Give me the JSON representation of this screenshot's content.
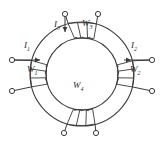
{
  "figure": {
    "type": "toroidal-core-winding-diagram",
    "background_color": "#ffffff",
    "line_color": "#3a3a3a",
    "label_color": "#2b2b2b"
  },
  "core": {
    "shape": "annulus",
    "center_x": 82,
    "center_y": 74,
    "outer_radius": 52,
    "inner_radius": 36
  },
  "windings": [
    {
      "id": "w1",
      "label_base": "W",
      "label_sub": "1",
      "position": "left",
      "angle_deg": 180,
      "turns": 3,
      "label_x": 28,
      "label_y": 70
    },
    {
      "id": "w2",
      "label_base": "W",
      "label_sub": "2",
      "position": "right",
      "angle_deg": 0,
      "turns": 3,
      "label_x": 130,
      "label_y": 70
    },
    {
      "id": "w3",
      "label_base": "W",
      "label_sub": "3",
      "position": "top",
      "angle_deg": 90,
      "turns": 3,
      "label_x": 86,
      "label_y": 25
    },
    {
      "id": "w4",
      "label_base": "W",
      "label_sub": "4",
      "position": "center-bottom",
      "angle_deg": 270,
      "turns": 3,
      "label_x": 76,
      "label_y": 86
    }
  ],
  "currents": [
    {
      "id": "i1",
      "label_base": "I",
      "label_sub": "1",
      "label_x": 24,
      "label_y": 48,
      "arrow": "right",
      "arrow_x1": 10,
      "arrow_y1": 60,
      "arrow_x2": 44,
      "arrow_y2": 60
    },
    {
      "id": "i2",
      "label_base": "I",
      "label_sub": "2",
      "label_x": 131,
      "label_y": 48,
      "arrow": "right",
      "arrow_x1": 120,
      "arrow_y1": 60,
      "arrow_x2": 152,
      "arrow_y2": 60
    },
    {
      "id": "i3",
      "label_base": "I",
      "label_sub": "3",
      "label_x": 56,
      "label_y": 26,
      "arrow": "down",
      "arrow_x1": 65,
      "arrow_y1": 14,
      "arrow_x2": 65,
      "arrow_y2": 34
    }
  ],
  "terminals": [
    {
      "id": "t-top-left",
      "cx": 65,
      "cy": 14
    },
    {
      "id": "t-top-right",
      "cx": 98,
      "cy": 14
    },
    {
      "id": "t-left-upper",
      "cx": 12,
      "cy": 60
    },
    {
      "id": "t-left-lower",
      "cx": 12,
      "cy": 91
    },
    {
      "id": "t-right-upper",
      "cx": 152,
      "cy": 60
    },
    {
      "id": "t-right-lower",
      "cx": 152,
      "cy": 91
    },
    {
      "id": "t-bottom-left",
      "cx": 64,
      "cy": 133
    },
    {
      "id": "t-bottom-right",
      "cx": 96,
      "cy": 133
    }
  ]
}
